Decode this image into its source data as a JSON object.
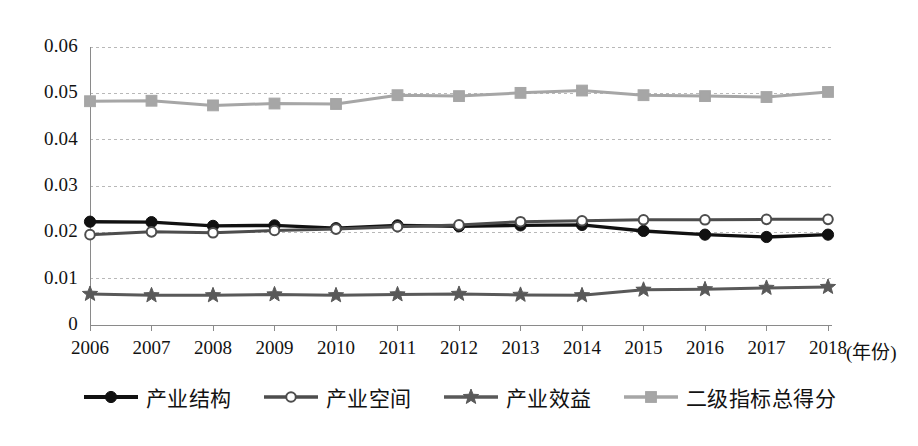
{
  "chart_data": {
    "type": "line",
    "title": "",
    "subtitle": "",
    "xlabel": "(年份)",
    "ylabel": "",
    "x": [
      2006,
      2007,
      2008,
      2009,
      2010,
      2011,
      2012,
      2013,
      2014,
      2015,
      2016,
      2017,
      2018
    ],
    "categories": [
      "2006",
      "2007",
      "2008",
      "2009",
      "2010",
      "2011",
      "2012",
      "2013",
      "2014",
      "2015",
      "2016",
      "2017",
      "2018"
    ],
    "xtick_labels": [
      "2006",
      "2007",
      "2008",
      "2009",
      "2010",
      "2011",
      "2012",
      "2013",
      "2014",
      "2015",
      "2016",
      "2017",
      "2018"
    ],
    "ytick_labels": [
      "0.06",
      "0.05",
      "0.04",
      "0.03",
      "0.02",
      "0.01",
      "0"
    ],
    "ytick_values": [
      0.06,
      0.05,
      0.04,
      0.03,
      0.02,
      0.01,
      0
    ],
    "ylim": [
      0,
      0.06
    ],
    "xlim": [
      2006,
      2018
    ],
    "grid": true,
    "grid_axis": "y",
    "legend_position": "bottom",
    "series": [
      {
        "name": "产业结构",
        "marker": "filled-circle",
        "color": "#111111",
        "values": [
          0.0223,
          0.0222,
          0.0214,
          0.0215,
          0.0209,
          0.0215,
          0.0213,
          0.0215,
          0.0216,
          0.0203,
          0.0195,
          0.019,
          0.0195
        ]
      },
      {
        "name": "产业空间",
        "marker": "open-circle",
        "color": "#4d4d4d",
        "values": [
          0.0195,
          0.0201,
          0.0199,
          0.0204,
          0.0207,
          0.0212,
          0.0216,
          0.0223,
          0.0225,
          0.0227,
          0.0227,
          0.0228,
          0.0228
        ]
      },
      {
        "name": "产业效益",
        "marker": "star",
        "color": "#595959",
        "values": [
          0.0067,
          0.0064,
          0.0064,
          0.0066,
          0.0064,
          0.0066,
          0.0067,
          0.0065,
          0.0064,
          0.0076,
          0.0077,
          0.008,
          0.0082
        ]
      },
      {
        "name": "二级指标总得分",
        "marker": "square",
        "color": "#a6a6a6",
        "values": [
          0.0483,
          0.0484,
          0.0474,
          0.0478,
          0.0477,
          0.0496,
          0.0494,
          0.0501,
          0.0506,
          0.0496,
          0.0494,
          0.0492,
          0.0503
        ]
      }
    ],
    "colors": {
      "series_1": "#111111",
      "series_2": "#4d4d4d",
      "series_3": "#595959",
      "series_4": "#a6a6a6",
      "grid": "#b8b8b8",
      "axis": "#8a8a8a",
      "text": "#121212",
      "background": "#ffffff"
    }
  },
  "legend": {
    "items": [
      {
        "label": "产业结构"
      },
      {
        "label": "产业空间"
      },
      {
        "label": "产业效益"
      },
      {
        "label": "二级指标总得分"
      }
    ]
  }
}
